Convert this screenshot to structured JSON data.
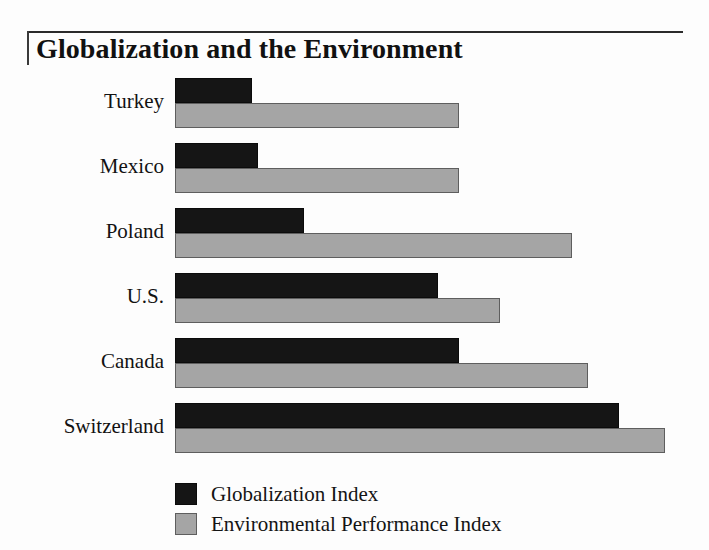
{
  "figure": {
    "title": "Globalization and the Environment"
  },
  "chart_data": {
    "type": "bar",
    "orientation": "horizontal",
    "title": "Globalization and the Environment",
    "xlabel": "",
    "ylabel": "",
    "grid": false,
    "xlim": [
      0,
      100
    ],
    "categories": [
      "Turkey",
      "Mexico",
      "Poland",
      "U.S.",
      "Canada",
      "Switzerland"
    ],
    "series": [
      {
        "name": "Globalization Index",
        "color": "#151515",
        "values": [
          15,
          16,
          25,
          51,
          55,
          86
        ]
      },
      {
        "name": "Environmental Performance Index",
        "color": "#a5a5a5",
        "values": [
          55,
          55,
          77,
          63,
          80,
          95
        ]
      }
    ],
    "legend_position": "bottom-left"
  },
  "legend": {
    "entries": [
      {
        "label": "Globalization Index",
        "swatch": "dark"
      },
      {
        "label": "Environmental Performance Index",
        "swatch": "light"
      }
    ]
  }
}
